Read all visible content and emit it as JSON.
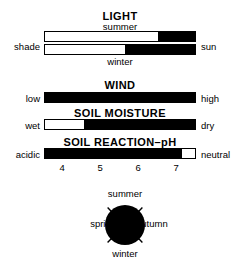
{
  "figure": {
    "caption_absent": true
  },
  "sections": [
    {
      "id": "light",
      "title": "LIGHT",
      "left_label": "shade",
      "right_label": "sun",
      "bars": [
        {
          "id": "light-summer",
          "label": "summer",
          "label_position": "above",
          "fill_start_pct": 75,
          "fill_end_pct": 100,
          "fill_color": "#000000",
          "empty_color": "#ffffff"
        },
        {
          "id": "light-winter",
          "label": "winter",
          "label_position": "below",
          "fill_start_pct": 53,
          "fill_end_pct": 100,
          "fill_color": "#000000",
          "empty_color": "#ffffff"
        }
      ]
    },
    {
      "id": "wind",
      "title": "WIND",
      "left_label": "low",
      "right_label": "high",
      "bars": [
        {
          "id": "wind-bar",
          "label": "",
          "fill_start_pct": 0,
          "fill_end_pct": 100,
          "fill_color": "#000000",
          "empty_color": "#ffffff"
        }
      ]
    },
    {
      "id": "soil-moisture",
      "title": "SOIL MOISTURE",
      "left_label": "wet",
      "right_label": "dry",
      "bars": [
        {
          "id": "soil-moisture-bar",
          "label": "",
          "fill_start_pct": 26,
          "fill_end_pct": 100,
          "fill_color": "#000000",
          "empty_color": "#ffffff"
        }
      ]
    },
    {
      "id": "soil-reaction",
      "title": "SOIL REACTION–pH",
      "left_label": "acidic",
      "right_label": "neutral",
      "bars": [
        {
          "id": "soil-reaction-bar",
          "label": "",
          "fill_start_pct": 0,
          "fill_end_pct": 91,
          "fill_color": "#000000",
          "empty_color": "#ffffff"
        }
      ],
      "axis": {
        "ticks": [
          "4",
          "5",
          "6",
          "7"
        ],
        "tick_positions_pct": [
          12,
          37,
          62,
          87
        ]
      }
    }
  ],
  "season_dial": {
    "id": "season-dial",
    "top_label": "summer",
    "right_label": "autumn",
    "bottom_label": "winter",
    "left_label": "spring",
    "fill_color": "#000000",
    "tick_count": 4
  },
  "chart_data": {
    "type": "bar",
    "xlabel": "",
    "ylabel": "",
    "grid": false,
    "legend": "none",
    "orientation": "horizontal",
    "scale_note": "Each bar spans the full axis from the left-hand label to the right-hand label; black segments mark the indicated range.",
    "categories": [
      "LIGHT – summer",
      "LIGHT – winter",
      "WIND",
      "SOIL MOISTURE",
      "SOIL REACTION–pH"
    ],
    "series": [
      {
        "name": "black segment start (% of bar)",
        "values": [
          75,
          53,
          0,
          26,
          0
        ]
      },
      {
        "name": "black segment end (% of bar)",
        "values": [
          100,
          100,
          100,
          100,
          91
        ]
      }
    ],
    "axis_endpoints": [
      {
        "category": "LIGHT – summer",
        "left": "shade",
        "right": "sun"
      },
      {
        "category": "LIGHT – winter",
        "left": "shade",
        "right": "sun"
      },
      {
        "category": "WIND",
        "left": "low",
        "right": "high"
      },
      {
        "category": "SOIL MOISTURE",
        "left": "wet",
        "right": "dry"
      },
      {
        "category": "SOIL REACTION–pH",
        "left": "acidic",
        "right": "neutral"
      }
    ],
    "ph_axis": {
      "ticks": [
        4,
        5,
        6,
        7
      ],
      "tick_positions_pct": [
        12,
        37,
        62,
        87
      ]
    },
    "season_dial": {
      "type": "pie",
      "labels": [
        "summer",
        "autumn",
        "winter",
        "spring"
      ],
      "values": [
        25,
        25,
        25,
        25
      ],
      "fill": "all",
      "note": "Fully filled black circle with four diagonal tick marks; season names placed at top, right, bottom and left."
    },
    "annotations": [
      "LIGHT",
      "summer",
      "shade",
      "sun",
      "winter",
      "WIND",
      "low",
      "high",
      "SOIL MOISTURE",
      "wet",
      "dry",
      "SOIL REACTION–pH",
      "acidic",
      "neutral",
      "4",
      "5",
      "6",
      "7",
      "summer",
      "spring",
      "autumn",
      "winter"
    ]
  }
}
